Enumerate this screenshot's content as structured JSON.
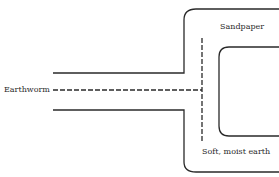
{
  "diagram": {
    "type": "T-maze",
    "labels": {
      "start": "Earthworm",
      "upper_arm": "Sandpaper",
      "lower_arm": "Soft, moist earth"
    },
    "colors": {
      "line": "#2a2a2a",
      "background": "#ffffff"
    }
  }
}
